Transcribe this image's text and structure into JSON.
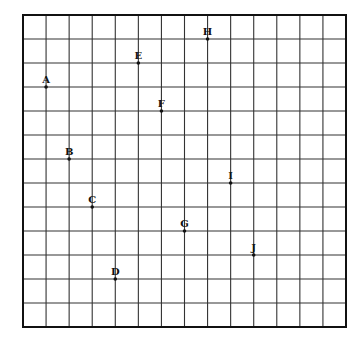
{
  "diagram": {
    "type": "coordinate-grid",
    "grid": {
      "columns": 14,
      "rows": 13,
      "left": 23,
      "top": 15,
      "right": 346,
      "bottom": 327,
      "line_color": "#333333",
      "border_color": "#111111"
    },
    "points": [
      {
        "label": "A",
        "col": 1,
        "row": 3
      },
      {
        "label": "B",
        "col": 2,
        "row": 6
      },
      {
        "label": "C",
        "col": 3,
        "row": 8
      },
      {
        "label": "D",
        "col": 4,
        "row": 11
      },
      {
        "label": "E",
        "col": 5,
        "row": 2
      },
      {
        "label": "F",
        "col": 6,
        "row": 4
      },
      {
        "label": "G",
        "col": 7,
        "row": 9
      },
      {
        "label": "H",
        "col": 8,
        "row": 1
      },
      {
        "label": "I",
        "col": 9,
        "row": 7
      },
      {
        "label": "J",
        "col": 10,
        "row": 10
      }
    ]
  }
}
